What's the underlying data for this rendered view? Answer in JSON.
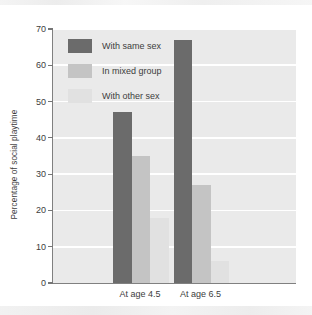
{
  "chart_data": {
    "type": "bar",
    "title": "",
    "subtitle": "",
    "xlabel": "",
    "ylabel": "Percentage of social playtime",
    "categories": [
      "At age 4.5",
      "At age 6.5"
    ],
    "series": [
      {
        "name": "With same sex",
        "color": "#6b6b6b",
        "values": [
          47,
          67
        ]
      },
      {
        "name": "In mixed group",
        "color": "#c4c4c4",
        "values": [
          35,
          27
        ]
      },
      {
        "name": "With other sex",
        "color": "#e1e1e1",
        "values": [
          18,
          6
        ]
      }
    ],
    "ylim": [
      0,
      70
    ],
    "yticks": [
      0,
      10,
      20,
      30,
      40,
      50,
      60,
      70
    ],
    "ytick_labels": [
      "0",
      "10",
      "20",
      "30",
      "40",
      "50",
      "60",
      "70"
    ],
    "grid": "horizontal-white",
    "legend_position": "inside-top-left",
    "plot_background": "#eaeaea",
    "axis_color": "#808080"
  }
}
